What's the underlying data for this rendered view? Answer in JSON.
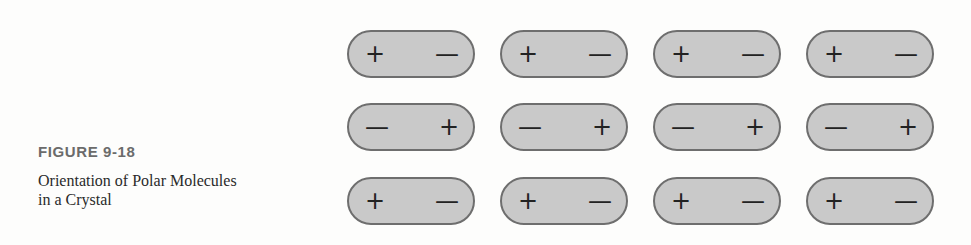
{
  "caption": {
    "figure_label": "FIGURE 9-18",
    "title_line1": "Orientation of Polar Molecules",
    "title_line2": "in a Crystal"
  },
  "diagram": {
    "colors": {
      "pill_fill": "#c9c9c9",
      "pill_border": "#6e6e6e",
      "sign": "#222222"
    },
    "rows": [
      {
        "molecules": [
          {
            "left": "+",
            "right": "—"
          },
          {
            "left": "+",
            "right": "—"
          },
          {
            "left": "+",
            "right": "—"
          },
          {
            "left": "+",
            "right": "—"
          }
        ]
      },
      {
        "molecules": [
          {
            "left": "—",
            "right": "+"
          },
          {
            "left": "—",
            "right": "+"
          },
          {
            "left": "—",
            "right": "+"
          },
          {
            "left": "—",
            "right": "+"
          }
        ]
      },
      {
        "molecules": [
          {
            "left": "+",
            "right": "—"
          },
          {
            "left": "+",
            "right": "—"
          },
          {
            "left": "+",
            "right": "—"
          },
          {
            "left": "+",
            "right": "—"
          }
        ]
      }
    ]
  }
}
